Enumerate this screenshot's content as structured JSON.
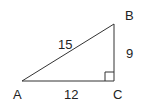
{
  "diagram": {
    "type": "right-triangle",
    "vertices": {
      "A": "A",
      "B": "B",
      "C": "C"
    },
    "sides": {
      "AB": "15",
      "BC": "9",
      "AC": "12"
    },
    "right_angle_at": "C",
    "colors": {
      "stroke": "#333333",
      "text": "#222222"
    }
  }
}
